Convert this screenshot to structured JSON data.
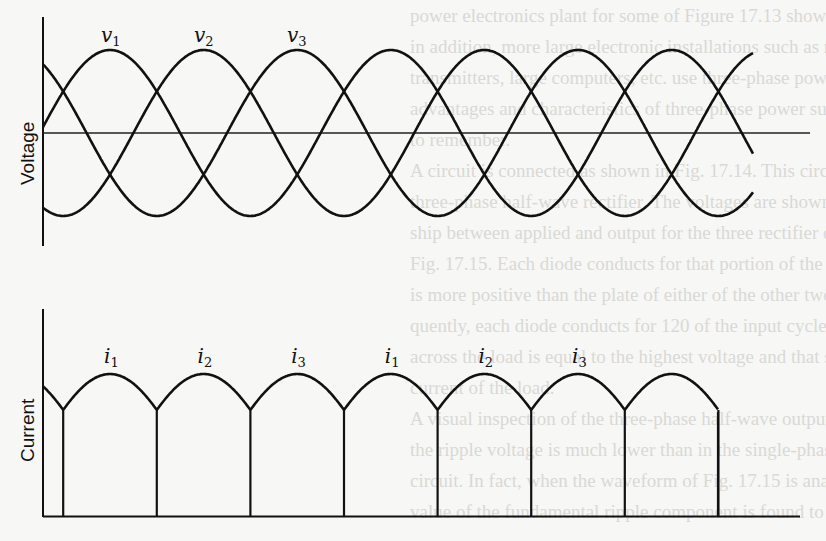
{
  "figure": {
    "type": "three-phase-rectifier-waveforms",
    "voltage_panel": {
      "ylabel": "Voltage",
      "wave_labels": [
        {
          "base": "v",
          "sub": "1"
        },
        {
          "base": "v",
          "sub": "2"
        },
        {
          "base": "v",
          "sub": "3"
        }
      ],
      "phase_shift_deg": 120,
      "phases": 3
    },
    "current_panel": {
      "ylabel": "Current",
      "pulse_labels": [
        {
          "base": "i",
          "sub": "1"
        },
        {
          "base": "i",
          "sub": "2"
        },
        {
          "base": "i",
          "sub": "3"
        },
        {
          "base": "i",
          "sub": "1"
        },
        {
          "base": "i",
          "sub": "2"
        },
        {
          "base": "i",
          "sub": "3"
        }
      ],
      "pulse_count": 7
    }
  },
  "chart_data": [
    {
      "type": "line",
      "title": "",
      "xlabel": "",
      "ylabel": "Voltage",
      "description": "Three sinusoidal phase voltages v1, v2, v3 displaced by 120 degrees, centered on a zero line",
      "series": [
        {
          "name": "v1",
          "peak_phase_deg": 90
        },
        {
          "name": "v2",
          "peak_phase_deg": 210
        },
        {
          "name": "v3",
          "peak_phase_deg": 330
        }
      ],
      "periods_shown": 2.5,
      "grid": false,
      "legend": "inline labels above first peaks"
    },
    {
      "type": "line",
      "title": "",
      "xlabel": "",
      "ylabel": "Current",
      "description": "Rectified output current made of sinusoidal arc segments i1, i2, i3 repeating, with vertical commutation lines at each cusp down to the baseline",
      "sequence": [
        "i1",
        "i2",
        "i3",
        "i1",
        "i2",
        "i3"
      ],
      "grid": false
    }
  ],
  "background_bleed_text": [
    "power electronics plant for some of Figure 17.13 shows a",
    "in addition, more large electronic installations such as radio and TV",
    "transmitters, large computers, etc. use three-phase power supplies. The",
    "advantages and characteristics of three-phase power supplies are easy",
    "to remember.",
    "A circuit is connected as shown in Fig. 17.14. This circuit is known as a",
    "three-phase half-wave rectifier. The voltages are shown and the relation-",
    "ship between applied and output for the three rectifier cells is shown in",
    "Fig. 17.15. Each diode conducts for that portion of the cycle while its plate",
    "is more positive than the plate of either of the other two diodes. Conse-",
    "quently, each diode conducts for 120 of the input cycle. Note the voltage",
    "across the load is equal to the highest voltage and that same form as the",
    "current of the load.",
    "A visual inspection of the three-phase half-wave output current indicates",
    "the ripple voltage is much lower than in the single-phase full-wave rectifier",
    "circuit. In fact, when the waveform of Fig. 17.15 is analyzed the rms",
    "value of the fundamental ripple component is found to be 0.18 times. As"
  ]
}
